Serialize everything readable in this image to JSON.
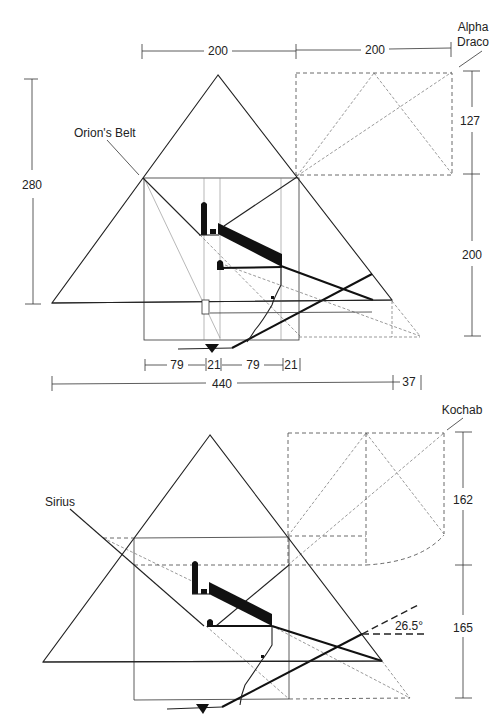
{
  "top_diagram": {
    "labels": {
      "star_upper": [
        "Alpha",
        "Draco"
      ],
      "star_left": "Orion's Belt"
    },
    "dimensions": {
      "top_left_width": "200",
      "top_right_width": "200",
      "left_height": "280",
      "right_upper_height": "127",
      "right_lower_height": "200",
      "bottom_segments": [
        "79",
        "21",
        "79",
        "21"
      ],
      "base_width": "440",
      "base_extension": "37"
    }
  },
  "bottom_diagram": {
    "labels": {
      "star_upper": "Kochab",
      "star_left": "Sirius",
      "angle": "26.5°"
    },
    "dimensions": {
      "right_upper_height": "162",
      "right_lower_height": "165"
    }
  }
}
